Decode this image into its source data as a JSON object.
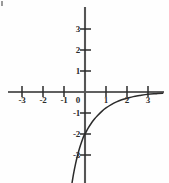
{
  "figure": {
    "background_color": "#fefefe",
    "ink_color": "#2b2b2b",
    "width": 169,
    "height": 183
  },
  "chart_data": {
    "type": "line",
    "title": "",
    "subtitle": "",
    "xlabel": "",
    "ylabel": "",
    "xlim": [
      -3.7,
      3.7
    ],
    "ylim": [
      -4.3,
      4.1
    ],
    "grid": false,
    "legend": null,
    "axes": {
      "x_axis_label": "",
      "y_axis_label": "",
      "x_ticks": [
        -3,
        -2,
        -1,
        1,
        2,
        3
      ],
      "y_ticks": [
        3,
        2,
        1,
        -1,
        -2,
        -3
      ],
      "x_tick_labels": [
        "-3",
        "-2",
        "-1",
        "1",
        "2",
        "3"
      ],
      "y_tick_labels": [
        "3",
        "2",
        "1",
        "-1",
        "-2",
        "-3"
      ],
      "origin_label": "0"
    },
    "series": [
      {
        "name": "curve",
        "description": "increasing exponential approaching y=0 asymptote from below",
        "y_intercept": -2,
        "asymptote": 0,
        "color": "#2b2b2b",
        "x": [
          -0.62,
          -0.55,
          -0.45,
          -0.35,
          -0.25,
          -0.15,
          -0.05,
          0.0,
          0.15,
          0.3,
          0.45,
          0.6,
          0.8,
          1.0,
          1.25,
          1.5,
          1.75,
          2.0,
          2.3,
          2.6,
          3.0,
          3.4,
          3.7
        ],
        "y": [
          -4.35,
          -3.92,
          -3.42,
          -3.0,
          -2.64,
          -2.34,
          -2.08,
          -2.0,
          -1.72,
          -1.49,
          -1.29,
          -1.12,
          -0.92,
          -0.76,
          -0.6,
          -0.47,
          -0.37,
          -0.3,
          -0.22,
          -0.17,
          -0.11,
          -0.08,
          -0.06
        ]
      }
    ],
    "tick_labels_positions": {
      "x": [
        {
          "value": -3,
          "text": "-3",
          "px": 22,
          "py": 101
        },
        {
          "value": -2,
          "text": "-2",
          "px": 43,
          "py": 101
        },
        {
          "value": -1,
          "text": "-1",
          "px": 64,
          "py": 101
        },
        {
          "value": 0,
          "text": "0",
          "px": 78,
          "py": 101
        },
        {
          "value": 1,
          "text": "1",
          "px": 106,
          "py": 101
        },
        {
          "value": 2,
          "text": "2",
          "px": 127,
          "py": 101
        },
        {
          "value": 3,
          "text": "3",
          "px": 148,
          "py": 101
        }
      ],
      "y": [
        {
          "value": 3,
          "text": "3",
          "px": 80,
          "py": 29
        },
        {
          "value": 2,
          "text": "2",
          "px": 80,
          "py": 50
        },
        {
          "value": 1,
          "text": "1",
          "px": 80,
          "py": 71
        },
        {
          "value": -1,
          "text": "-1",
          "px": 80,
          "py": 113
        },
        {
          "value": -2,
          "text": "-2",
          "px": 80,
          "py": 134
        },
        {
          "value": -3,
          "text": "-3",
          "px": 80,
          "py": 155
        }
      ]
    }
  }
}
